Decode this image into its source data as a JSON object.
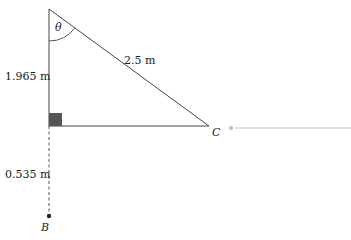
{
  "diagram": {
    "type": "right-triangle",
    "labels": {
      "angle": "θ",
      "hypotenuse": "2.5 m",
      "vertical_upper": "1.965 m",
      "vertical_lower": "0.535 m",
      "point_c": "C",
      "point_b": "B"
    },
    "geometry": {
      "top_vertex": [
        49,
        9
      ],
      "right_angle_vertex": [
        49,
        126
      ],
      "c_vertex": [
        209,
        126
      ],
      "b_point": [
        49,
        216
      ]
    },
    "colors": {
      "line": "#444444",
      "right_angle_marker": "#555555",
      "extension_line": "#bbbbbb",
      "text": "#222222"
    }
  }
}
